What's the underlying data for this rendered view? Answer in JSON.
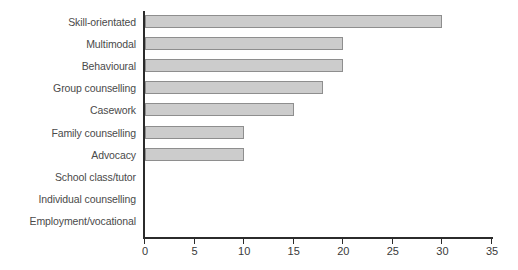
{
  "chart_data": {
    "type": "bar",
    "orientation": "horizontal",
    "title": "",
    "subtitle": "",
    "xlabel": "",
    "ylabel": "",
    "categories": [
      "Skill-orientated",
      "Multimodal",
      "Behavioural",
      "Group counselling",
      "Casework",
      "Family counselling",
      "Advocacy",
      "School class/tutor",
      "Individual counselling",
      "Employment/vocational"
    ],
    "values": [
      30,
      20,
      20,
      18,
      15,
      10,
      10,
      0,
      0,
      0
    ],
    "xlim": [
      0,
      35
    ],
    "xticks": [
      0,
      5,
      10,
      15,
      20,
      25,
      30,
      35
    ],
    "xtick_labels": [
      "0",
      "5",
      "10",
      "15",
      "20",
      "25",
      "30",
      "35"
    ],
    "grid": false,
    "legend": false,
    "legend_position": "none",
    "bar_fill_color": "#cccccc",
    "bar_border_color": "#8e8e8e",
    "axis_color": "#2b2b2b",
    "label_color": "#4a4a4a",
    "background_color": "#ffffff"
  }
}
